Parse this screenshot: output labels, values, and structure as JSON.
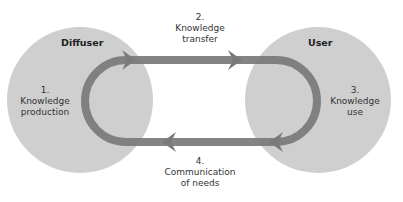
{
  "diagram": {
    "nodes": [
      {
        "id": "diffuser",
        "title": "Diffuser",
        "step_number": "1.",
        "step_line1": "Knowledge",
        "step_line2": "production"
      },
      {
        "id": "user",
        "title": "User",
        "step_number": "3.",
        "step_line1": "Knowledge",
        "step_line2": "use"
      }
    ],
    "edges": [
      {
        "id": "transfer",
        "from": "diffuser",
        "to": "user",
        "step_number": "2.",
        "line1": "Knowledge",
        "line2": "transfer"
      },
      {
        "id": "needs",
        "from": "user",
        "to": "diffuser",
        "step_number": "4.",
        "line1": "Communication",
        "line2": "of needs"
      }
    ],
    "colors": {
      "circle_fill": "#cfcfcf",
      "arrow": "#7a7a7a",
      "text": "#333333"
    }
  }
}
